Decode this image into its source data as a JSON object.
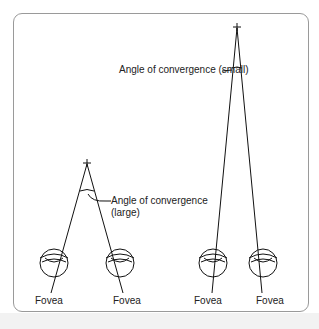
{
  "figure": {
    "labels": {
      "small_angle": "Angle of convergence (small)",
      "large_angle_line1": "Angle of convergence",
      "large_angle_line2": "(large)",
      "fovea_left_1": "Fovea",
      "fovea_left_2": "Fovea",
      "fovea_right_1": "Fovea",
      "fovea_right_2": "Fovea"
    },
    "icons": {
      "fixation_point": "plus-mark",
      "eye": "eye-cross-section"
    }
  }
}
